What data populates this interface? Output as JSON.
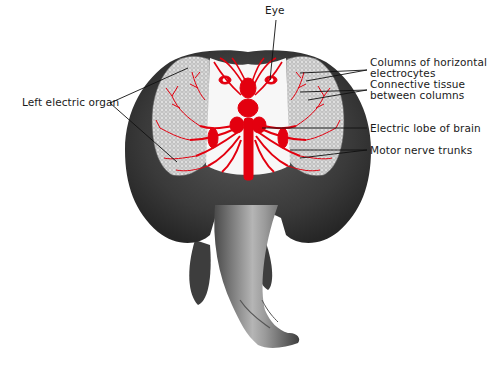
{
  "diagram": {
    "colors": {
      "body_dark": "#3a3a3a",
      "body_mid": "#6b6b6b",
      "tail_light": "#a8a8a8",
      "organ_fill": "#d9d9d9",
      "nerve_red": "#e3000f",
      "leader_line": "#111111",
      "background": "#ffffff"
    },
    "labels": {
      "eye": "Eye",
      "left_electric_organ": "Left electric organ",
      "columns_line1": "Columns of horizontal",
      "columns_line2": "electrocytes",
      "connective_line1": "Connective tissue",
      "connective_line2": "between columns",
      "electric_lobe": "Electric lobe of brain",
      "motor_nerve": "Motor nerve trunks"
    }
  }
}
